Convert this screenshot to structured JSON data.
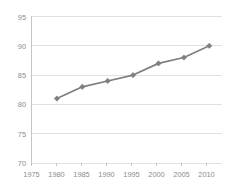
{
  "chart_data": {
    "type": "line",
    "title": "",
    "subtitle": "",
    "xlabel": "",
    "ylabel": "",
    "x": [
      1980,
      1985,
      1990,
      1995,
      2000,
      2005,
      2010
    ],
    "values": [
      81,
      83,
      84,
      85,
      87,
      88,
      90
    ],
    "series": [
      {
        "name": "series-1",
        "x": [
          1980,
          1985,
          1990,
          1995,
          2000,
          2005,
          2010
        ],
        "values": [
          81,
          83,
          84,
          85,
          87,
          88,
          90
        ]
      }
    ],
    "xlim": [
      1975,
      2012.5
    ],
    "ylim": [
      70,
      95
    ],
    "x_tick_labels": [
      "1975",
      "1980",
      "1985",
      "1990",
      "1995",
      "2000",
      "2005",
      "2010"
    ],
    "x_ticks": [
      1975,
      1980,
      1985,
      1990,
      1995,
      2000,
      2005,
      2010
    ],
    "y_tick_labels": [
      "70",
      "75",
      "80",
      "85",
      "90",
      "95"
    ],
    "y_ticks": [
      70,
      75,
      80,
      85,
      90,
      95
    ],
    "grid": "horizontal",
    "legend": "none",
    "annotations": [],
    "colors": {
      "line": "#7f7f7f",
      "marker": "#7f7f7f",
      "grid": "#d9d9d9",
      "axis": "#bfbfbf",
      "tick_label": "#8c8c8c",
      "background": "#ffffff"
    }
  },
  "ticks": {
    "y": {
      "t0": "95",
      "t1": "90",
      "t2": "85",
      "t3": "80",
      "t4": "75",
      "t5": "70"
    },
    "x": {
      "t0": "1975",
      "t1": "1980",
      "t2": "1985",
      "t3": "1990",
      "t4": "1995",
      "t5": "2000",
      "t6": "2005",
      "t7": "2010"
    }
  }
}
